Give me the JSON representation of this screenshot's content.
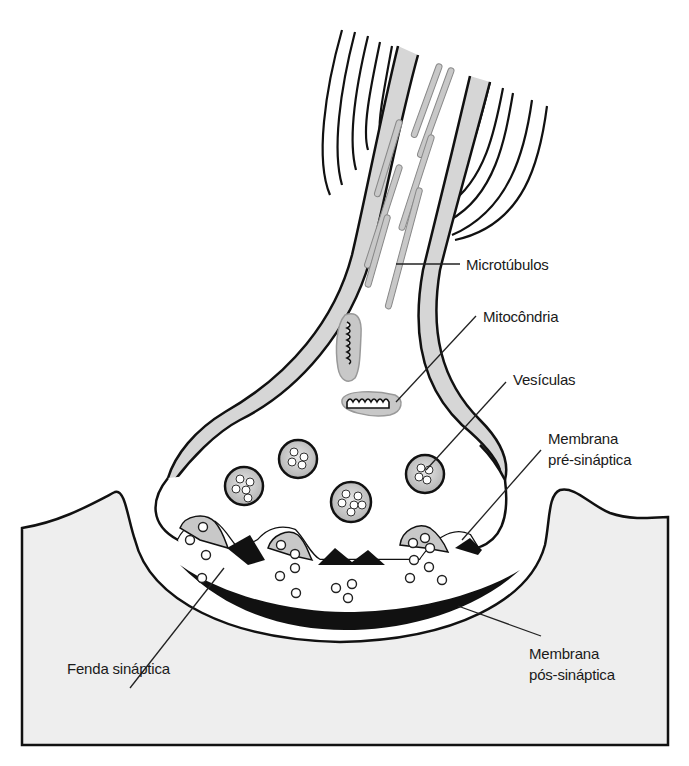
{
  "diagram": {
    "labels": {
      "microtubulos": "Microtúbulos",
      "mitocondria": "Mitocôndria",
      "vesiculas": "Vesículas",
      "membrana_pre_line1": "Membrana",
      "membrana_pre_line2": "pré-sináptica",
      "fenda": "Fenda sináptica",
      "membrana_pos_line1": "Membrana",
      "membrana_pos_line2": "pós-sináptica"
    },
    "colors": {
      "outline": "#111111",
      "myelin_gray": "#d6d6d6",
      "organelle_gray": "#c8c8c8",
      "postsynaptic_fill": "#eeeeee",
      "background": "#ffffff"
    }
  }
}
